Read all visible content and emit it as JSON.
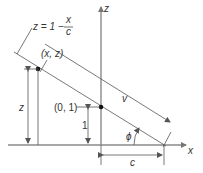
{
  "diagram": {
    "type": "geometry",
    "axes": {
      "horizontal_label": "x",
      "vertical_label": "z"
    },
    "line_equation": {
      "lhs": "z = 1 −",
      "numerator": "x",
      "denominator": "c"
    },
    "points": [
      {
        "label": "(x, z)"
      },
      {
        "label": "(0, 1)"
      }
    ],
    "dimensions": {
      "height_z": "z",
      "height_one": "1",
      "intercept_c": "c"
    },
    "vector_label": "v",
    "angle_label": "ϕ",
    "colors": {
      "line": "#555555",
      "axis": "#8a8a8a",
      "point": "#111111",
      "text": "#333333"
    }
  }
}
